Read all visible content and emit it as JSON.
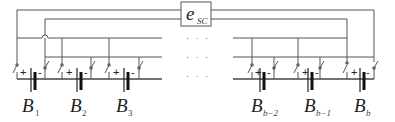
{
  "diagram": {
    "supercap": {
      "symbol": "e",
      "subscript": "SC"
    },
    "battery_polarity": {
      "plus": "+",
      "minus": "-"
    },
    "ellipsis": "· · ·",
    "batteries": [
      {
        "symbol": "B",
        "subscript": "1"
      },
      {
        "symbol": "B",
        "subscript": "2"
      },
      {
        "symbol": "B",
        "subscript": "3"
      },
      {
        "symbol": "B",
        "subscript": "b−2"
      },
      {
        "symbol": "B",
        "subscript": "b−1"
      },
      {
        "symbol": "B",
        "subscript": "b"
      }
    ],
    "colors": {
      "wire": "#555555",
      "plates": "#222222",
      "background": "#ffffff"
    }
  }
}
